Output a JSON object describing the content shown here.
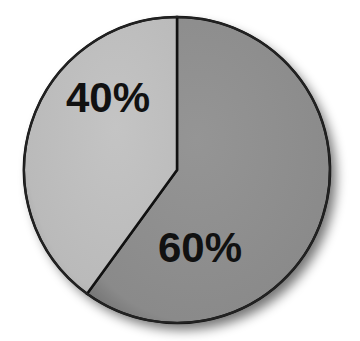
{
  "chart_data": {
    "type": "pie",
    "title": "",
    "categories": [
      "Segment A",
      "Segment B"
    ],
    "values": [
      40,
      60
    ],
    "labels": [
      "40%",
      "60%"
    ],
    "colors": [
      "#bdbdbd",
      "#8e8e8e"
    ],
    "start_angle_deg": 0,
    "direction": "clockwise-from-top: 60% slice first, then 40%",
    "legend": "none"
  },
  "labels": {
    "small": "40%",
    "large": "60%"
  }
}
